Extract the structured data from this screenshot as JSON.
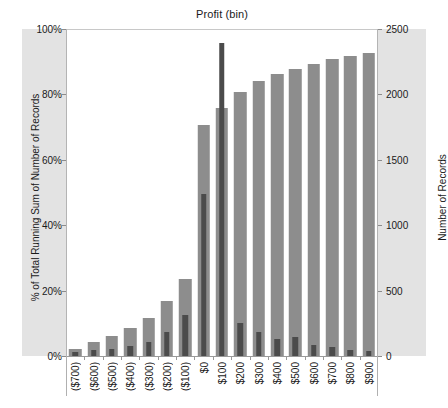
{
  "chart_data": {
    "type": "bar",
    "title": "Profit (bin)",
    "xlabel": "",
    "grid": false,
    "legend": "none",
    "categories": [
      "($700)",
      "($600)",
      "($500)",
      "($400)",
      "($300)",
      "($200)",
      "($100)",
      "$0",
      "$100",
      "$200",
      "$300",
      "$400",
      "$500",
      "$600",
      "$700",
      "$800",
      "$900"
    ],
    "axes": {
      "left": {
        "label": "% of Total Running Sum of Number of Records",
        "ticks": [
          "0%",
          "20%",
          "40%",
          "60%",
          "80%",
          "100%"
        ],
        "tick_values": [
          0,
          20,
          40,
          60,
          80,
          100
        ],
        "lim": [
          0,
          100
        ]
      },
      "right": {
        "label": "Number of Records",
        "ticks": [
          "0",
          "500",
          "1000",
          "1500",
          "2000",
          "2500"
        ],
        "tick_values": [
          0,
          500,
          1000,
          1500,
          2000,
          2500
        ],
        "lim": [
          0,
          2500
        ]
      }
    },
    "series": [
      {
        "name": "% of Total Running Sum of Number of Records",
        "axis": "left",
        "unit": "percent",
        "color": "#8d8d8d",
        "values": [
          2.5,
          4.5,
          6.5,
          9,
          12,
          17,
          24,
          71,
          76,
          81,
          84.5,
          86.5,
          88,
          89.5,
          91,
          92,
          93
        ]
      },
      {
        "name": "Number of Records",
        "axis": "right",
        "unit": "records",
        "color": "#4b4b4b",
        "values": [
          40,
          55,
          60,
          85,
          115,
          190,
          320,
          1250,
          2400,
          260,
          195,
          140,
          150,
          95,
          80,
          55,
          45
        ]
      }
    ]
  }
}
